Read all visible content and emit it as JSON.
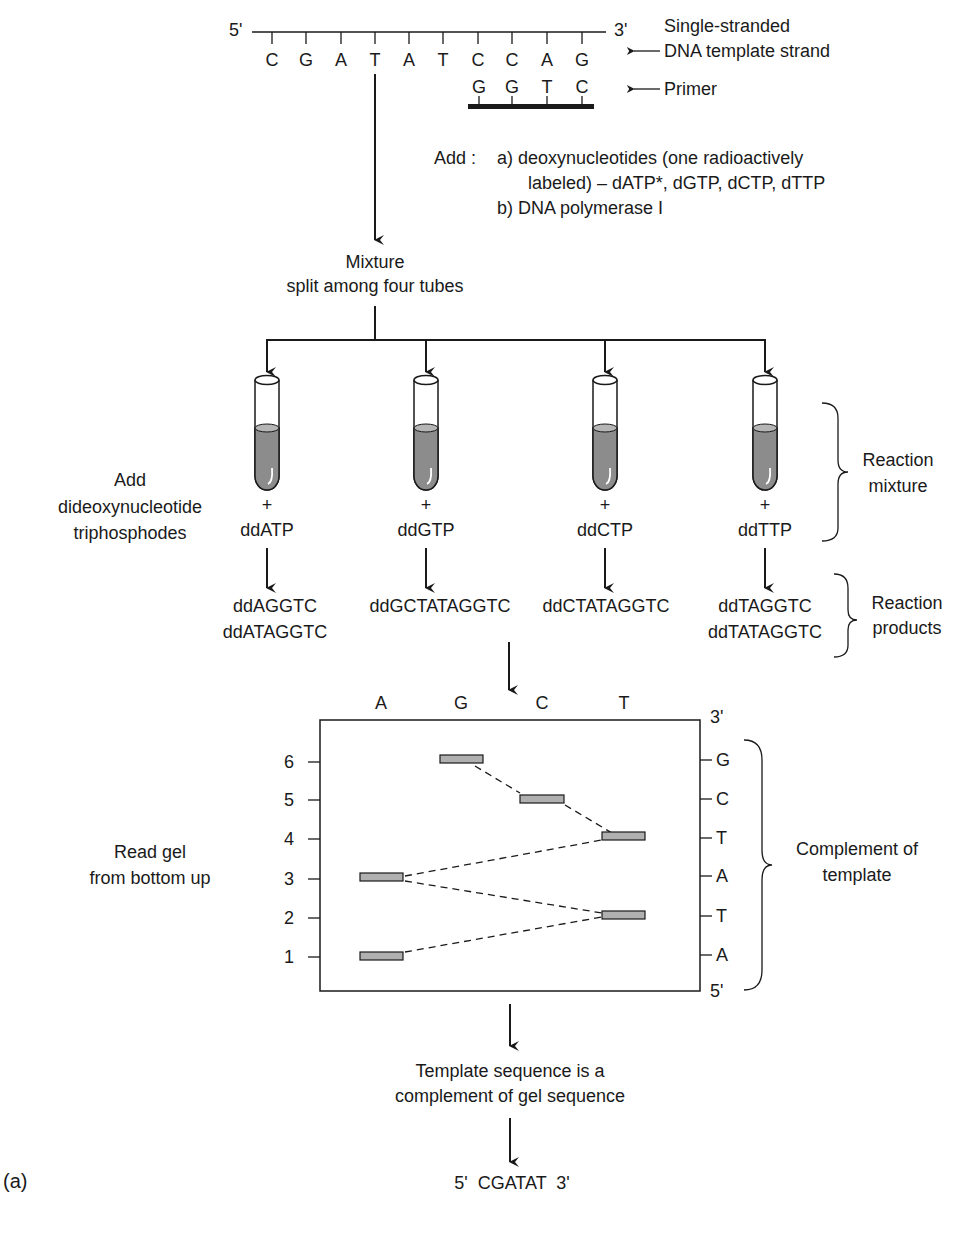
{
  "template": {
    "five_prime": "5'",
    "three_prime": "3'",
    "bases": [
      "C",
      "G",
      "A",
      "T",
      "A",
      "T",
      "C",
      "C",
      "A",
      "G"
    ],
    "label_line1": "Single-stranded",
    "label_line2": "DNA template strand"
  },
  "primer": {
    "bases": [
      "G",
      "G",
      "T",
      "C"
    ],
    "label": "Primer"
  },
  "add_step": {
    "prefix": "Add :",
    "a_line1": "a) deoxynucleotides (one radioactively",
    "a_line2": "labeled) – dATP*, dGTP, dCTP, dTTP",
    "b_line": "b)  DNA polymerase I"
  },
  "mixture": {
    "line1": "Mixture",
    "line2": "split among four tubes"
  },
  "add_dideoxy": {
    "line1": "Add",
    "line2": "dideoxynucleotide",
    "line3": "triphosphodes"
  },
  "tubes": [
    {
      "plus": "+",
      "label": "ddATP",
      "products": [
        "ddAGGTC",
        "ddATAGGTC"
      ]
    },
    {
      "plus": "+",
      "label": "ddGTP",
      "products": [
        "ddGCTATAGGTC"
      ]
    },
    {
      "plus": "+",
      "label": "ddCTP",
      "products": [
        "ddCTATAGGTC"
      ]
    },
    {
      "plus": "+",
      "label": "ddTTP",
      "products": [
        "ddTAGGTC",
        "ddTATAGGTC"
      ]
    }
  ],
  "brackets": {
    "reaction_mixture_1": "Reaction",
    "reaction_mixture_2": "mixture",
    "reaction_products_1": "Reaction",
    "reaction_products_2": "products"
  },
  "gel": {
    "lanes": [
      "A",
      "G",
      "C",
      "T"
    ],
    "left_ticks": [
      "6",
      "5",
      "4",
      "3",
      "2",
      "1"
    ],
    "right_top": "3'",
    "right_bottom": "5'",
    "right_ticks": [
      "G",
      "C",
      "T",
      "A",
      "T",
      "A"
    ],
    "read_label_1": "Read gel",
    "read_label_2": "from bottom up",
    "complement_1": "Complement of",
    "complement_2": "template",
    "bands": [
      {
        "lane": "A",
        "position": 1
      },
      {
        "lane": "T",
        "position": 2
      },
      {
        "lane": "A",
        "position": 3
      },
      {
        "lane": "T",
        "position": 4
      },
      {
        "lane": "C",
        "position": 5
      },
      {
        "lane": "G",
        "position": 6
      }
    ]
  },
  "conclusion": {
    "line1": "Template sequence is a",
    "line2": "complement of gel sequence",
    "result": "5'  CGATAT  3'"
  },
  "panel_label": "(a)",
  "colors": {
    "ink": "#1a1a1a",
    "liquid": "#8c8c8c",
    "band": "#b0b0b0"
  }
}
